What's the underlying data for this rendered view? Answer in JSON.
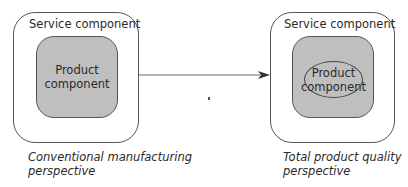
{
  "diagram": {
    "left": {
      "outer_label": "Service component",
      "inner_label_line1": "Product",
      "inner_label_line2": "component",
      "caption_line1": "Conventional manufacturing",
      "caption_line2": "perspective"
    },
    "right": {
      "outer_label": "Service component",
      "inner_label_line1": "Product",
      "inner_label_line2": "component",
      "caption_line1": "Total product quality",
      "caption_line2": "perspective"
    },
    "arrow": {
      "direction": "left-to-right"
    },
    "colors": {
      "outline": "#555555",
      "inner_fill": "#bfbfbf",
      "background": "#ffffff"
    }
  }
}
